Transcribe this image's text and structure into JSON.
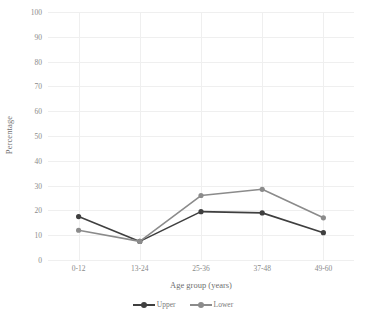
{
  "chart_data": {
    "type": "line",
    "title": "",
    "xlabel": "Age group (years)",
    "ylabel": "Percentage",
    "categories": [
      "0-12",
      "13-24",
      "25-36",
      "37-48",
      "49-60"
    ],
    "series": [
      {
        "name": "Upper",
        "values": [
          17.5,
          7.5,
          19.5,
          19,
          11
        ],
        "color": "#3f3f3f"
      },
      {
        "name": "Lower",
        "values": [
          12,
          7.5,
          26,
          28.5,
          17
        ],
        "color": "#8b8b8b"
      }
    ],
    "ylim": [
      0,
      100
    ],
    "yticks": [
      0,
      10,
      20,
      30,
      40,
      50,
      60,
      70,
      80,
      90,
      100
    ],
    "ytick_labels": [
      "0",
      "10",
      "20",
      "30",
      "40",
      "50",
      "60",
      "70",
      "80",
      "90",
      "100"
    ],
    "grid": true,
    "grid_color": "#efefef",
    "legend_position": "bottom-center",
    "background": "#ffffff"
  },
  "legend": {
    "items": [
      {
        "label": "Upper"
      },
      {
        "label": "Lower"
      }
    ]
  },
  "axes": {
    "y_title": "Percentage",
    "x_title": "Age group (years)"
  }
}
